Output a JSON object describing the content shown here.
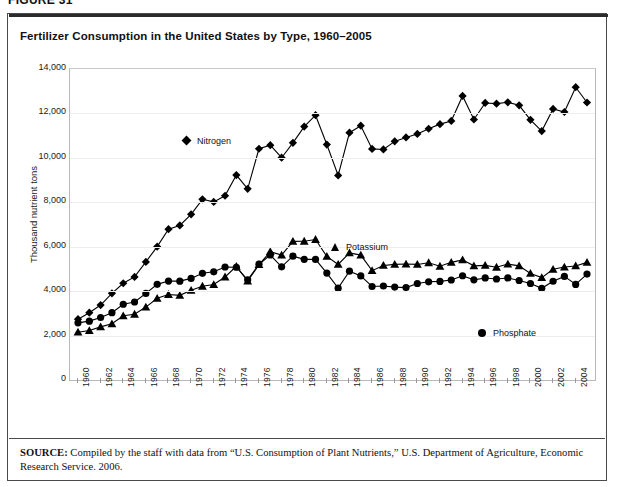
{
  "figure": {
    "label": "FIGURE 31",
    "title": "Fertilizer Consumption in the United States by Type, 1960–2005",
    "source_prefix": "SOURCE:",
    "source_text": " Compiled by the staff with data from “U.S. Consumption of Plant Nutrients,” U.S. Department of Agriculture, Economic Research Service. 2006."
  },
  "legend": {
    "nitrogen": "Nitrogen",
    "potassium": "Potassium",
    "phosphate": "Phosphate"
  },
  "chart_data": {
    "type": "line",
    "title": "Fertilizer Consumption in the United States by Type, 1960–2005",
    "xlabel": "",
    "ylabel": "Thousand nutrient tons",
    "ylim": [
      0,
      14000
    ],
    "yticks": [
      0,
      2000,
      4000,
      6000,
      8000,
      10000,
      12000,
      14000
    ],
    "ytick_labels": [
      "0",
      "2,000",
      "4,000",
      "6,000",
      "8,000",
      "10,000",
      "12,000",
      "14,000"
    ],
    "xlim": [
      1960,
      2005
    ],
    "xticks": [
      1960,
      1962,
      1964,
      1966,
      1968,
      1970,
      1972,
      1974,
      1976,
      1978,
      1980,
      1982,
      1984,
      1986,
      1988,
      1990,
      1992,
      1994,
      1996,
      1998,
      2000,
      2002,
      2004
    ],
    "xtick_labels": [
      "1960",
      "1962",
      "1964",
      "1966",
      "1968",
      "1970",
      "1972",
      "1974",
      "1976",
      "1978",
      "1980",
      "1982",
      "1984",
      "1986",
      "1988",
      "1990",
      "1992",
      "1994",
      "1996",
      "1998",
      "2000",
      "2002",
      "2004"
    ],
    "grid": true,
    "legend_position": "inline-annotations",
    "x": [
      1960,
      1961,
      1962,
      1963,
      1964,
      1965,
      1966,
      1967,
      1968,
      1969,
      1970,
      1971,
      1972,
      1973,
      1974,
      1975,
      1976,
      1977,
      1978,
      1979,
      1980,
      1981,
      1982,
      1983,
      1984,
      1985,
      1986,
      1987,
      1988,
      1989,
      1990,
      1991,
      1992,
      1993,
      1994,
      1995,
      1996,
      1997,
      1998,
      1999,
      2000,
      2001,
      2002,
      2003,
      2004,
      2005
    ],
    "series": [
      {
        "name": "Nitrogen",
        "marker": "diamond",
        "values": [
          2738,
          3031,
          3373,
          3904,
          4355,
          4639,
          5315,
          6003,
          6788,
          6957,
          7459,
          8134,
          8018,
          8294,
          9226,
          8606,
          10410,
          10570,
          10006,
          10675,
          11407,
          11920,
          10599,
          9209,
          11134,
          11447,
          10403,
          10379,
          10742,
          10920,
          11077,
          11310,
          11518,
          11662,
          12788,
          11726,
          12471,
          12441,
          12500,
          12365,
          11713,
          11204,
          12204,
          12065,
          13180,
          12491
        ]
      },
      {
        "name": "Phosphate",
        "marker": "circle",
        "values": [
          2572,
          2650,
          2814,
          3032,
          3410,
          3511,
          3897,
          4305,
          4453,
          4450,
          4574,
          4804,
          4871,
          5086,
          5076,
          4510,
          5212,
          5626,
          5094,
          5576,
          5432,
          5430,
          4814,
          4135,
          4899,
          4686,
          4210,
          4232,
          4181,
          4159,
          4345,
          4420,
          4438,
          4502,
          4693,
          4508,
          4595,
          4546,
          4594,
          4479,
          4345,
          4126,
          4446,
          4663,
          4304,
          4769
        ]
      },
      {
        "name": "Potassium",
        "marker": "triangle",
        "values": [
          2153,
          2225,
          2391,
          2529,
          2890,
          2959,
          3283,
          3676,
          3851,
          3811,
          4036,
          4220,
          4296,
          4636,
          5113,
          4450,
          5193,
          5776,
          5625,
          6242,
          6245,
          6325,
          5563,
          5202,
          5724,
          5622,
          4922,
          5157,
          5203,
          5220,
          5203,
          5279,
          5120,
          5296,
          5408,
          5138,
          5160,
          5075,
          5220,
          5138,
          4797,
          4610,
          4982,
          5084,
          5135,
          5294
        ]
      }
    ]
  }
}
